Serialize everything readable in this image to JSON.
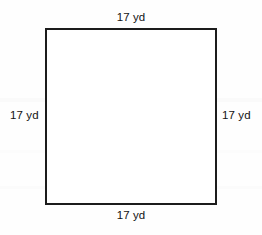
{
  "figure": {
    "name": "square-with-side-lengths",
    "shape": "square",
    "stroke_color": "#1c1c1c",
    "fill_color": "#ffffff",
    "background_color": "#fefefe",
    "labels": {
      "top": "17 yd",
      "right": "17 yd",
      "bottom": "17 yd",
      "left": "17 yd"
    },
    "measurement": {
      "value": "17",
      "unit": "yd"
    }
  }
}
